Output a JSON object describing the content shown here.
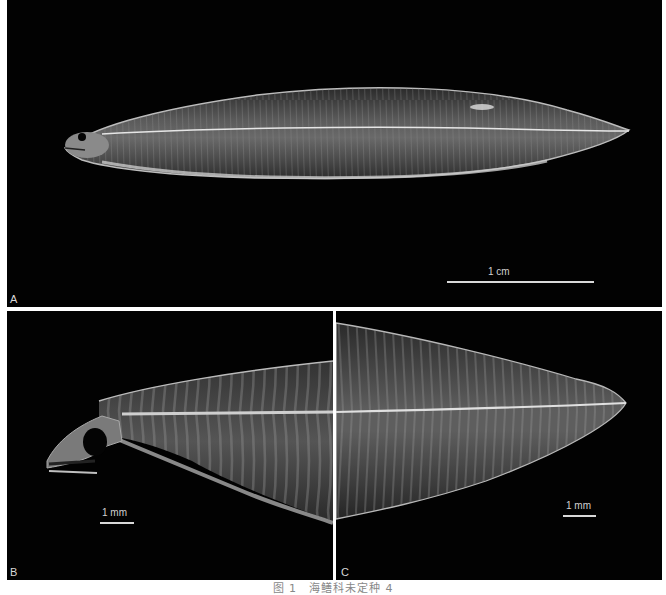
{
  "figure": {
    "caption": "图 1　海鳝科未定种 4",
    "background_color": "#020202",
    "panels": [
      {
        "id": "A",
        "label": "A",
        "description": "Whole specimen, lateral view (leptocephalus larva), head to the left",
        "scale_bar": {
          "label": "1 cm"
        }
      },
      {
        "id": "B",
        "label": "B",
        "description": "Head and anterior body, lateral view",
        "scale_bar": {
          "label": "1 mm"
        }
      },
      {
        "id": "C",
        "label": "C",
        "description": "Posterior body and tail, lateral view",
        "scale_bar": {
          "label": "1 mm"
        }
      }
    ]
  }
}
